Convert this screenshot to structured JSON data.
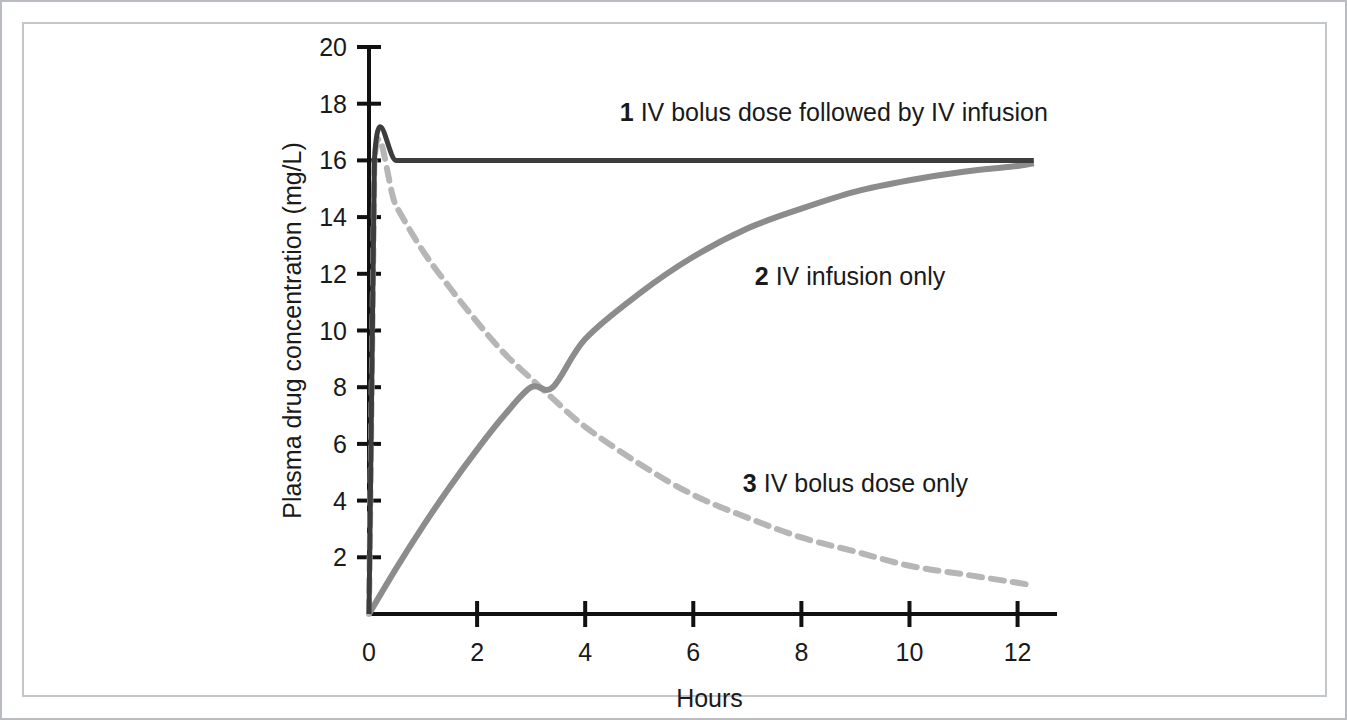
{
  "figure": {
    "frame_color": "#b9bcc0",
    "background": "#ffffff"
  },
  "chart_data": {
    "type": "line",
    "title": "",
    "xlabel": "Hours",
    "ylabel": "Plasma drug concentration (mg/L)",
    "xlim": [
      0,
      12.6
    ],
    "ylim": [
      0,
      20
    ],
    "xticks": [
      0,
      2,
      4,
      6,
      8,
      10,
      12
    ],
    "xtick_labels": [
      "0",
      "2",
      "4",
      "6",
      "8",
      "10",
      "12"
    ],
    "yticks": [
      2,
      4,
      6,
      8,
      10,
      12,
      14,
      16,
      18,
      20
    ],
    "ytick_labels": [
      "2",
      "4",
      "6",
      "8",
      "10",
      "12",
      "14",
      "16",
      "18",
      "20"
    ],
    "grid": false,
    "legend_position": "inline-annotations",
    "steady_state_concentration": 16,
    "elimination_half_life_hours": 3.1,
    "crossover_point": {
      "x": 3.4,
      "y": 8
    },
    "series": [
      {
        "id": 1,
        "name": "IV bolus dose followed by IV infusion",
        "label_number": "1",
        "label_text": "IV bolus dose followed by IV infusion",
        "color": "#3d3d3d",
        "style": "solid",
        "width": 5,
        "x": [
          0,
          0.1,
          0.5,
          1,
          2,
          3,
          4,
          5,
          6,
          7,
          8,
          9,
          10,
          11,
          12,
          12.3
        ],
        "y": [
          0,
          16.0,
          16.0,
          16.0,
          16.0,
          16.0,
          16.0,
          16.0,
          16.0,
          16.0,
          16.0,
          16.0,
          16.0,
          16.0,
          16.0,
          16.0
        ],
        "label_x": 8.6,
        "label_y": 17.4
      },
      {
        "id": 2,
        "name": "IV infusion only",
        "label_number": "2",
        "label_text": "IV infusion only",
        "color": "#8c8c8c",
        "style": "solid",
        "width": 6,
        "x": [
          0,
          0.5,
          1,
          1.5,
          2,
          2.5,
          3,
          3.4,
          4,
          5,
          6,
          7,
          8,
          9,
          10,
          11,
          12,
          12.3
        ],
        "y": [
          0,
          1.6,
          3.1,
          4.5,
          5.8,
          7.0,
          8.0,
          8.0,
          9.7,
          11.3,
          12.6,
          13.6,
          14.3,
          14.9,
          15.3,
          15.6,
          15.8,
          15.9
        ],
        "label_x": 8.9,
        "label_y": 11.6
      },
      {
        "id": 3,
        "name": "IV bolus dose only",
        "label_number": "3",
        "label_text": "IV bolus dose only",
        "color": "#b6b6b6",
        "style": "dashed",
        "width": 6,
        "dash": "13,9",
        "x": [
          0,
          0.1,
          0.5,
          1,
          1.5,
          2,
          2.5,
          3,
          3.4,
          4,
          5,
          6,
          7,
          8,
          9,
          10,
          11,
          12,
          12.3
        ],
        "y": [
          0,
          15.9,
          14.4,
          12.8,
          11.5,
          10.3,
          9.2,
          8.3,
          7.6,
          6.6,
          5.3,
          4.2,
          3.4,
          2.7,
          2.2,
          1.7,
          1.4,
          1.1,
          1.0
        ],
        "label_x": 9.0,
        "label_y": 4.3
      }
    ]
  }
}
